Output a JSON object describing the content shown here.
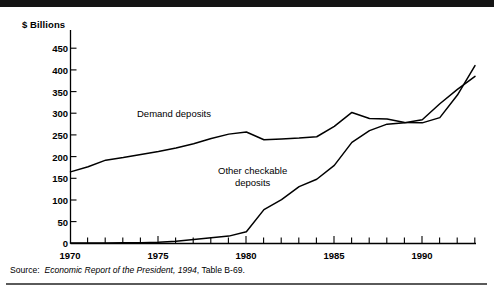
{
  "figure": {
    "unit_label": "$ Billions",
    "source_prefix": "Source:",
    "source_title": "Economic Report of the President, 1994",
    "source_suffix": ", Table B-69.",
    "line_color": "#000000",
    "rule_color": "#141414"
  },
  "chart_data": {
    "type": "line",
    "title": "",
    "xlabel": "",
    "ylabel": "$ Billions",
    "xlim": [
      1970,
      1993
    ],
    "ylim": [
      0,
      470
    ],
    "yticks": [
      0,
      50,
      100,
      150,
      200,
      250,
      300,
      350,
      400,
      450
    ],
    "ytick_labels": [
      "0",
      "50",
      "100",
      "150",
      "200",
      "250",
      "300",
      "350",
      "400",
      "450"
    ],
    "xticks": [
      1970,
      1975,
      1980,
      1985,
      1990
    ],
    "xtick_labels": [
      "1970",
      "1975",
      "1980",
      "1985",
      "1990"
    ],
    "minor_xticks_every": 1,
    "grid": false,
    "legend": "inline annotations",
    "x": [
      1970,
      1971,
      1972,
      1973,
      1974,
      1975,
      1976,
      1977,
      1978,
      1979,
      1980,
      1981,
      1982,
      1983,
      1984,
      1985,
      1986,
      1987,
      1988,
      1989,
      1990,
      1991,
      1992,
      1993
    ],
    "series": [
      {
        "name": "Demand deposits",
        "values": [
          165,
          177,
          192,
          198,
          205,
          212,
          220,
          230,
          242,
          252,
          257,
          239,
          241,
          243,
          246,
          270,
          302,
          288,
          287,
          279,
          278,
          290,
          342,
          410
        ]
      },
      {
        "name": "Other checkable deposits",
        "values": [
          1,
          1,
          1,
          2,
          2,
          3,
          5,
          9,
          13,
          17,
          27,
          78,
          101,
          131,
          148,
          180,
          233,
          260,
          275,
          278,
          285,
          322,
          355,
          385
        ]
      }
    ]
  }
}
